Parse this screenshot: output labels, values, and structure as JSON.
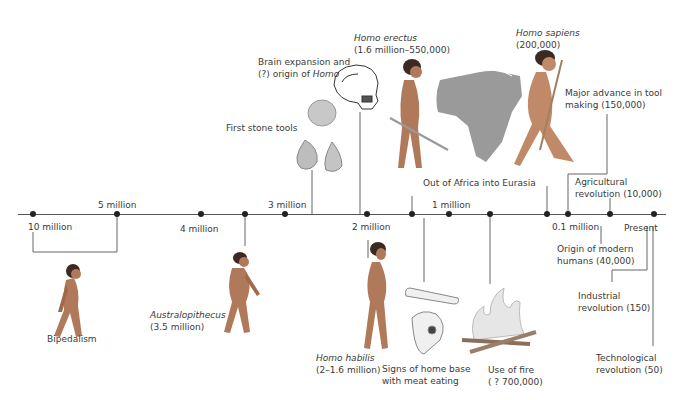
{
  "diagram": {
    "type": "timeline",
    "timeline": {
      "ticks": [
        {
          "label": "10 million",
          "x": 33,
          "pos": "below"
        },
        {
          "label": "5 million",
          "x": 117,
          "pos": "above"
        },
        {
          "label": "4 million",
          "x": 201,
          "pos": "below"
        },
        {
          "label": "3 million",
          "x": 285,
          "pos": "above"
        },
        {
          "label": "2 million",
          "x": 367,
          "pos": "below"
        },
        {
          "label": "1 million",
          "x": 449,
          "pos": "above"
        },
        {
          "label": "0.1 million",
          "x": 568,
          "pos": "below"
        },
        {
          "label": "Present",
          "x": 654,
          "pos": "below"
        }
      ],
      "event_dots_x": [
        33,
        117,
        201,
        245,
        285,
        367,
        412,
        449,
        490,
        547,
        568,
        610,
        654
      ]
    },
    "events": {
      "bipedalism": {
        "label": "Bipedalism"
      },
      "australopithecus": {
        "name": "Australopithecus",
        "date": "(3.5 million)"
      },
      "stone_tools": {
        "label": "First stone tools"
      },
      "brain": {
        "line1": "Brain expansion and",
        "line2_prefix": "(?) origin of ",
        "line2_italic": "Homo"
      },
      "erectus": {
        "name": "Homo erectus",
        "date": "(1.6 million–550,000)"
      },
      "out_of_africa": {
        "label": "Out of Africa into Eurasia"
      },
      "habilis": {
        "name": "Homo habilis",
        "date": "(2–1.6 million)"
      },
      "home_base": {
        "line1": "Signs of home base",
        "line2": "with meat eating"
      },
      "fire": {
        "line1": "Use of fire",
        "line2": "( ? 700,000)"
      },
      "sapiens": {
        "name": "Homo sapiens",
        "date": "(200,000)"
      },
      "tool_making": {
        "line1": "Major advance in tool",
        "line2": "making (150,000)"
      },
      "agricultural": {
        "line1": "Agricultural",
        "line2": "revolution (10,000)"
      },
      "modern_humans": {
        "line1": "Origin of modern",
        "line2": "humans (40,000)"
      },
      "industrial": {
        "line1": "Industrial",
        "line2": "revolution (150)"
      },
      "technological": {
        "line1": "Technological",
        "line2": "revolution (50)"
      }
    },
    "colors": {
      "skin": "#b07a5a",
      "hair": "#3a2a22",
      "map": "#9a9a9a",
      "fire": "#d8d8d8",
      "line": "#555555"
    }
  }
}
